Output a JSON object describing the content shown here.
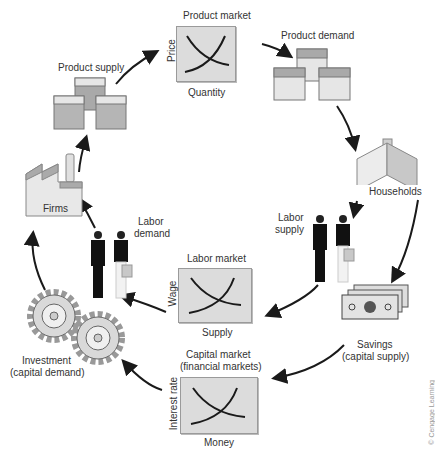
{
  "diagram": {
    "type": "circular-flow",
    "nodes": {
      "product_market": {
        "title": "Product market",
        "y_axis": "Price",
        "x_axis": "Quantity"
      },
      "product_demand": {
        "label": "Product demand"
      },
      "households": {
        "label": "Households"
      },
      "labor_supply": {
        "label_line1": "Labor",
        "label_line2": "supply"
      },
      "savings": {
        "label_line1": "Savings",
        "label_line2": "(capital supply)"
      },
      "capital_market": {
        "title_line1": "Capital market",
        "title_line2": "(financial markets)",
        "y_axis": "Interest rate",
        "x_axis": "Money"
      },
      "investment": {
        "label_line1": "Investment",
        "label_line2": "(capital demand)"
      },
      "labor_market": {
        "title": "Labor market",
        "y_axis": "Wage",
        "x_axis": "Supply"
      },
      "labor_demand": {
        "label_line1": "Labor",
        "label_line2": "demand"
      },
      "firms": {
        "label": "Firms"
      },
      "product_supply": {
        "label": "Product supply"
      }
    },
    "flows": [
      "Product supply -> Product market",
      "Product market -> Product demand",
      "Product demand -> Households",
      "Households -> Labor supply",
      "Households -> Savings",
      "Labor supply -> Labor market",
      "Savings -> Capital market",
      "Labor market -> Labor demand",
      "Capital market -> Investment",
      "Labor demand -> Firms",
      "Investment -> Firms",
      "Firms -> Product supply"
    ],
    "copyright": "© Cengage Learning"
  },
  "colors": {
    "market_bg": "#dcdcdc",
    "arrow": "#1a1a1a",
    "box_dark": "#a9a9a9",
    "box_light": "#e6e6e6"
  }
}
